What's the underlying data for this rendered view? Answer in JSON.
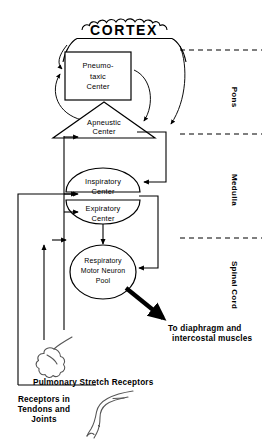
{
  "figure": {
    "title": "CORTEX",
    "background_color": "#ffffff",
    "line_color": "#000000"
  },
  "nodes": {
    "cortex": {
      "label": "CORTEX",
      "shape": "scalloped-dome"
    },
    "pneumotaxic": {
      "line1": "Pneumo-",
      "line2": "taxic",
      "line3": "Center",
      "shape": "rectangle"
    },
    "apneustic": {
      "line1": "Apneustic",
      "line2": "Center",
      "shape": "triangle"
    },
    "inspiratory": {
      "line1": "Inspiratory",
      "line2": "Center",
      "shape": "upper-half-ellipse"
    },
    "expiratory": {
      "line1": "Expiratory",
      "line2": "Center",
      "shape": "lower-half-ellipse"
    },
    "motor_pool": {
      "line1": "Respiratory",
      "line2": "Motor Neuron",
      "line3": "Pool",
      "shape": "ellipse"
    }
  },
  "regions": [
    {
      "name": "pons",
      "label": "Pons"
    },
    {
      "name": "medulla",
      "label": "Medulla"
    },
    {
      "name": "spinal_cord",
      "label": "Spinal Cord"
    }
  ],
  "captions": {
    "output": {
      "line1": "To diaphragm and",
      "line2": "intercostal muscles"
    },
    "pulmonary": {
      "line1": "Pulmonary Stretch Receptors"
    },
    "tendons": {
      "line1": "Receptors in",
      "line2": "Tendons and",
      "line3": "Joints"
    }
  },
  "organs": {
    "lung": {
      "name": "lung-icon"
    },
    "leg": {
      "name": "leg-icon"
    }
  }
}
